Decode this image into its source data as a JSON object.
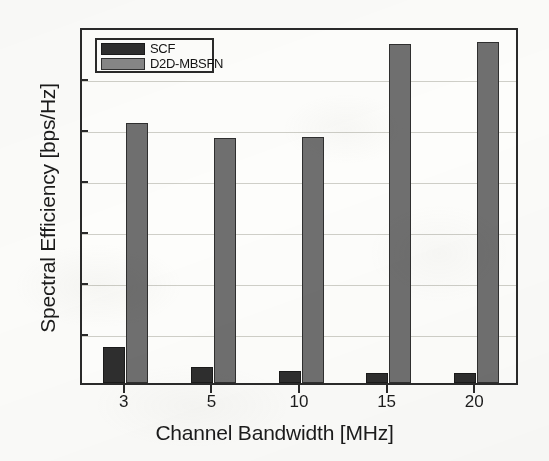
{
  "chart_data": {
    "type": "bar",
    "title": "",
    "xlabel": "Channel Bandwidth  [MHz]",
    "ylabel": "Spectral Efficiency [bps/Hz]",
    "categories": [
      "3",
      "5",
      "10",
      "15",
      "20"
    ],
    "series": [
      {
        "name": "SCF",
        "color": "#2e2e2e",
        "values": [
          3.5,
          1.6,
          1.2,
          1.0,
          1.0
        ]
      },
      {
        "name": "D2D-MBSFN",
        "color": "#6f6f6f",
        "values": [
          25.5,
          24.0,
          24.1,
          33.2,
          33.4
        ]
      }
    ],
    "ylim": [
      0,
      35
    ],
    "yticks": [
      "0",
      "5",
      "10",
      "15",
      "20",
      "25",
      "30",
      "35"
    ],
    "xticks": [
      "3",
      "5",
      "10",
      "15",
      "20"
    ],
    "grid": true,
    "legend_position": "top-left"
  },
  "axes": {
    "y_title": "Spectral Efficiency [bps/Hz]",
    "x_title": "Channel Bandwidth  [MHz]"
  },
  "legend": {
    "entries": [
      {
        "label": "SCF"
      },
      {
        "label": "D2D-MBSFN"
      }
    ]
  }
}
